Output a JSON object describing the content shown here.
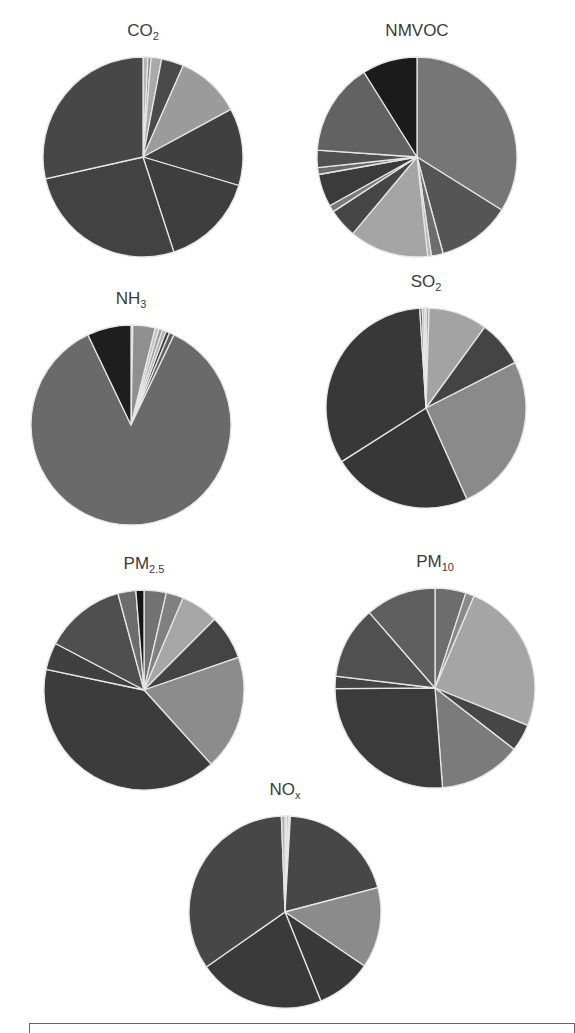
{
  "chart_data": [
    {
      "type": "pie",
      "title": "CO2",
      "title_main": "CO",
      "title_sub": "2",
      "center": [
        143,
        157
      ],
      "radius": 100,
      "slices": [
        {
          "value": 0.8,
          "color": "#b5b5b5"
        },
        {
          "value": 0.5,
          "color": "#8a8a8a"
        },
        {
          "value": 1.7,
          "color": "#a9a9a9"
        },
        {
          "value": 3.6,
          "color": "#4a4a4a"
        },
        {
          "value": 10.5,
          "color": "#9b9b9b"
        },
        {
          "value": 12.5,
          "color": "#404040"
        },
        {
          "value": 15.4,
          "color": "#3e3e3e"
        },
        {
          "value": 26.5,
          "color": "#424242"
        },
        {
          "value": 28.5,
          "color": "#474747"
        }
      ]
    },
    {
      "type": "pie",
      "title": "NMVOC",
      "title_main": "NMVOC",
      "title_sub": "",
      "center": [
        417,
        157
      ],
      "radius": 100,
      "slices": [
        {
          "value": 33.9,
          "color": "#767676"
        },
        {
          "value": 11.9,
          "color": "#555555"
        },
        {
          "value": 1.9,
          "color": "#6d6d6d"
        },
        {
          "value": 0.6,
          "color": "#b8b8b8"
        },
        {
          "value": 12.8,
          "color": "#a5a5a5"
        },
        {
          "value": 4.7,
          "color": "#464646"
        },
        {
          "value": 1.1,
          "color": "#7a7a7a"
        },
        {
          "value": 5.3,
          "color": "#3b3b3b"
        },
        {
          "value": 1.1,
          "color": "#6b6b6b"
        },
        {
          "value": 2.8,
          "color": "#505050"
        },
        {
          "value": 15.0,
          "color": "#626262"
        },
        {
          "value": 8.9,
          "color": "#1b1b1b"
        }
      ]
    },
    {
      "type": "pie",
      "title": "NH3",
      "title_main": "NH",
      "title_sub": "3",
      "center": [
        131,
        425
      ],
      "radius": 100,
      "slices": [
        {
          "value": 0.3,
          "color": "#b5b5b5"
        },
        {
          "value": 3.6,
          "color": "#8f8f8f"
        },
        {
          "value": 0.6,
          "color": "#c3c3c3"
        },
        {
          "value": 0.6,
          "color": "#9c9c9c"
        },
        {
          "value": 0.6,
          "color": "#adadad"
        },
        {
          "value": 0.6,
          "color": "#3d3d3d"
        },
        {
          "value": 0.8,
          "color": "#5f5f5f"
        },
        {
          "value": 85.8,
          "color": "#6a6a6a"
        },
        {
          "value": 7.1,
          "color": "#1e1e1e"
        }
      ]
    },
    {
      "type": "pie",
      "title": "SO2",
      "title_main": "SO",
      "title_sub": "2",
      "center": [
        426,
        408
      ],
      "radius": 100,
      "slices": [
        {
          "value": 0.5,
          "color": "#aaaaaa"
        },
        {
          "value": 9.5,
          "color": "#a3a3a3"
        },
        {
          "value": 7.5,
          "color": "#444444"
        },
        {
          "value": 25.8,
          "color": "#8a8a8a"
        },
        {
          "value": 22.7,
          "color": "#373737"
        },
        {
          "value": 33.0,
          "color": "#383838"
        },
        {
          "value": 0.4,
          "color": "#505050"
        },
        {
          "value": 0.3,
          "color": "#707070"
        },
        {
          "value": 0.3,
          "color": "#c4c4c4"
        }
      ]
    },
    {
      "type": "pie",
      "title": "PM2.5",
      "title_main": "PM",
      "title_sub": "2.5",
      "center": [
        144,
        690
      ],
      "radius": 100,
      "slices": [
        {
          "value": 3.6,
          "color": "#727272"
        },
        {
          "value": 2.8,
          "color": "#808080"
        },
        {
          "value": 6.1,
          "color": "#a6a6a6"
        },
        {
          "value": 7.2,
          "color": "#444444"
        },
        {
          "value": 18.6,
          "color": "#8c8c8c"
        },
        {
          "value": 40.0,
          "color": "#3c3c3c"
        },
        {
          "value": 4.4,
          "color": "#404040"
        },
        {
          "value": 13.1,
          "color": "#4f4f4f"
        },
        {
          "value": 2.9,
          "color": "#6d6d6d"
        },
        {
          "value": 1.3,
          "color": "#151515"
        }
      ]
    },
    {
      "type": "pie",
      "title": "PM10",
      "title_main": "PM",
      "title_sub": "10",
      "center": [
        435,
        688
      ],
      "radius": 100,
      "slices": [
        {
          "value": 5.0,
          "color": "#6d6d6d"
        },
        {
          "value": 1.4,
          "color": "#8a8a8a"
        },
        {
          "value": 24.7,
          "color": "#a5a5a5"
        },
        {
          "value": 4.4,
          "color": "#464646"
        },
        {
          "value": 13.3,
          "color": "#7b7b7b"
        },
        {
          "value": 26.1,
          "color": "#3b3b3b"
        },
        {
          "value": 2.0,
          "color": "#444444"
        },
        {
          "value": 11.7,
          "color": "#505050"
        },
        {
          "value": 11.4,
          "color": "#5f5f5f"
        }
      ]
    },
    {
      "type": "pie",
      "title": "NOx",
      "title_main": "NO",
      "title_sub": "x",
      "center": [
        285,
        912
      ],
      "radius": 96,
      "slices": [
        {
          "value": 0.3,
          "color": "#bdbdbd"
        },
        {
          "value": 0.3,
          "color": "#9a9a9a"
        },
        {
          "value": 0.3,
          "color": "#cccccc"
        },
        {
          "value": 20.0,
          "color": "#474747"
        },
        {
          "value": 13.6,
          "color": "#8b8b8b"
        },
        {
          "value": 9.4,
          "color": "#393939"
        },
        {
          "value": 21.4,
          "color": "#3a3a3a"
        },
        {
          "value": 34.1,
          "color": "#474747"
        },
        {
          "value": 0.6,
          "color": "#b0b0b0"
        }
      ]
    }
  ],
  "layout": {
    "separator_color": "#e6e6e6",
    "legend_box_partially_visible": true
  }
}
